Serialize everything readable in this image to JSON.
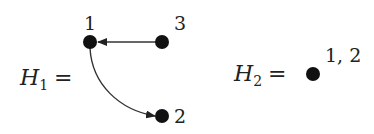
{
  "graphs": [
    {
      "name": "H",
      "subscript": "1",
      "equals": "=",
      "nodes": [
        {
          "id": "1",
          "label": "1"
        },
        {
          "id": "2",
          "label": "2"
        },
        {
          "id": "3",
          "label": "3"
        }
      ],
      "edges": [
        {
          "from": "3",
          "to": "1",
          "style": "straight"
        },
        {
          "from": "1",
          "to": "2",
          "style": "curved"
        }
      ]
    },
    {
      "name": "H",
      "subscript": "2",
      "equals": "=",
      "nodes": [
        {
          "id": "1,2",
          "label": "1, 2"
        }
      ],
      "edges": []
    }
  ],
  "colors": {
    "node": "#111111",
    "edge": "#333333",
    "text": "#222222"
  }
}
